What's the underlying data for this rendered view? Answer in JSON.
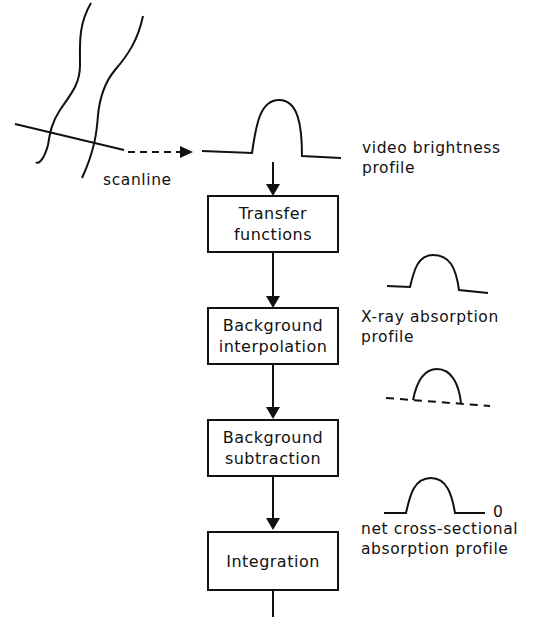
{
  "diagram": {
    "scanline_label": "scanline",
    "steps": [
      {
        "id": "transfer",
        "label_line1": "Transfer",
        "label_line2": "functions"
      },
      {
        "id": "bg-interp",
        "label_line1": "Background",
        "label_line2": "interpolation"
      },
      {
        "id": "bg-sub",
        "label_line1": "Background",
        "label_line2": "subtraction"
      },
      {
        "id": "integration",
        "label_line1": "Integration",
        "label_line2": ""
      }
    ],
    "profiles": [
      {
        "id": "video",
        "label_line1": "video brightness",
        "label_line2": "profile"
      },
      {
        "id": "xray",
        "label_line1": "X-ray absorption",
        "label_line2": "profile"
      },
      {
        "id": "interp",
        "label_line1": "",
        "label_line2": ""
      },
      {
        "id": "net",
        "label_line1": "net cross-sectional",
        "label_line2": "absorption profile",
        "zero_marker": "0"
      }
    ]
  }
}
